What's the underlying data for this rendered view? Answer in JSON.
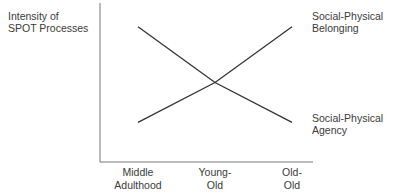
{
  "chart_data": {
    "type": "line",
    "title": "",
    "ylabel": "Intensity of SPOT Processes",
    "ylabel_lines": [
      "Intensity of",
      "SPOT Processes"
    ],
    "xlabel": "",
    "categories": [
      "Middle Adulthood",
      "Young-Old",
      "Old-Old"
    ],
    "category_lines": [
      [
        "Middle",
        "Adulthood"
      ],
      [
        "Young-",
        "Old"
      ],
      [
        "Old-",
        "Old"
      ]
    ],
    "ylim": [
      0,
      1
    ],
    "grid": false,
    "y_ticks_shown": false,
    "series": [
      {
        "name": "Social-Physical Belonging",
        "name_lines": [
          "Social-Physical",
          "Belonging"
        ],
        "values": [
          0.25,
          0.5,
          0.85
        ],
        "color": "#333333"
      },
      {
        "name": "Social-Physical Agency",
        "name_lines": [
          "Social-Physical",
          "Agency"
        ],
        "values": [
          0.85,
          0.5,
          0.25
        ],
        "color": "#333333"
      }
    ],
    "legend": "right, labels placed at line ends"
  }
}
